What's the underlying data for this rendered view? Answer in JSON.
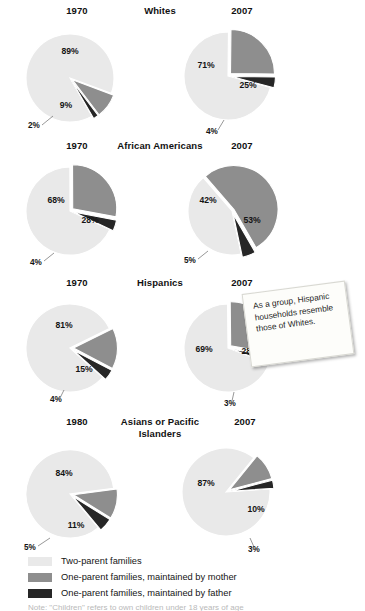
{
  "colors": {
    "two_parent": "#e9e9e9",
    "mother": "#8e8e8e",
    "father": "#262626",
    "note_bg": "#fdfdfa",
    "text": "#141414"
  },
  "legend": {
    "items": [
      {
        "label": "Two-parent families",
        "color": "#e9e9e9",
        "swatch_name": "swatch-two-parent"
      },
      {
        "label": "One-parent families, maintained by mother",
        "color": "#8e8e8e",
        "swatch_name": "swatch-mother"
      },
      {
        "label": "One-parent families, maintained by father",
        "color": "#262626",
        "swatch_name": "swatch-father"
      }
    ]
  },
  "callout": {
    "text": "As a group, Hispanic households resemble those of Whites."
  },
  "footer": {
    "text": "Note: \"Children\" refers to own children under 18 years of age"
  },
  "rows": [
    {
      "group": "Whites",
      "left_year": "1970",
      "right_year": "2007",
      "left": {
        "two_parent": "89%",
        "mother": "9%",
        "father": "2%"
      },
      "right": {
        "two_parent": "71%",
        "mother": "25%",
        "father": "4%"
      }
    },
    {
      "group": "African Americans",
      "left_year": "1970",
      "right_year": "2007",
      "left": {
        "two_parent": "68%",
        "mother": "28%",
        "father": "4%"
      },
      "right": {
        "two_parent": "42%",
        "mother": "53%",
        "father": "5%"
      }
    },
    {
      "group": "Hispanics",
      "left_year": "1970",
      "right_year": "2007",
      "left": {
        "two_parent": "81%",
        "mother": "15%",
        "father": "4%"
      },
      "right": {
        "two_parent": "69%",
        "mother": "28%",
        "father": "3%"
      }
    },
    {
      "group": "Asians or Pacific Islanders",
      "left_year": "1980",
      "right_year": "2007",
      "left": {
        "two_parent": "84%",
        "mother": "11%",
        "father": "5%"
      },
      "right": {
        "two_parent": "87%",
        "mother": "10%",
        "father": "3%"
      }
    }
  ],
  "chart_data": {
    "type": "pie",
    "legend_position": "bottom",
    "series_names": [
      "Two-parent families",
      "One-parent families, maintained by mother",
      "One-parent families, maintained by father"
    ],
    "charts": [
      {
        "group": "Whites",
        "year": "1970",
        "labels": [
          "Two-parent families",
          "One-parent families, maintained by mother",
          "One-parent families, maintained by father"
        ],
        "values": [
          89,
          9,
          2
        ],
        "value_labels": [
          "89%",
          "9%",
          "2%"
        ]
      },
      {
        "group": "Whites",
        "year": "2007",
        "labels": [
          "Two-parent families",
          "One-parent families, maintained by mother",
          "One-parent families, maintained by father"
        ],
        "values": [
          71,
          25,
          4
        ],
        "value_labels": [
          "71%",
          "25%",
          "4%"
        ]
      },
      {
        "group": "African Americans",
        "year": "1970",
        "labels": [
          "Two-parent families",
          "One-parent families, maintained by mother",
          "One-parent families, maintained by father"
        ],
        "values": [
          68,
          28,
          4
        ],
        "value_labels": [
          "68%",
          "28%",
          "4%"
        ]
      },
      {
        "group": "African Americans",
        "year": "2007",
        "labels": [
          "Two-parent families",
          "One-parent families, maintained by mother",
          "One-parent families, maintained by father"
        ],
        "values": [
          42,
          53,
          5
        ],
        "value_labels": [
          "42%",
          "53%",
          "5%"
        ]
      },
      {
        "group": "Hispanics",
        "year": "1970",
        "labels": [
          "Two-parent families",
          "One-parent families, maintained by mother",
          "One-parent families, maintained by father"
        ],
        "values": [
          81,
          15,
          4
        ],
        "value_labels": [
          "81%",
          "15%",
          "4%"
        ]
      },
      {
        "group": "Hispanics",
        "year": "2007",
        "labels": [
          "Two-parent families",
          "One-parent families, maintained by mother",
          "One-parent families, maintained by father"
        ],
        "values": [
          69,
          28,
          3
        ],
        "value_labels": [
          "69%",
          "28%",
          "3%"
        ]
      },
      {
        "group": "Asians or Pacific Islanders",
        "year": "1980",
        "labels": [
          "Two-parent families",
          "One-parent families, maintained by mother",
          "One-parent families, maintained by father"
        ],
        "values": [
          84,
          11,
          5
        ],
        "value_labels": [
          "84%",
          "11%",
          "5%"
        ]
      },
      {
        "group": "Asians or Pacific Islanders",
        "year": "2007",
        "labels": [
          "Two-parent families",
          "One-parent families, maintained by mother",
          "One-parent families, maintained by father"
        ],
        "values": [
          87,
          10,
          3
        ],
        "value_labels": [
          "87%",
          "10%",
          "3%"
        ]
      }
    ]
  }
}
